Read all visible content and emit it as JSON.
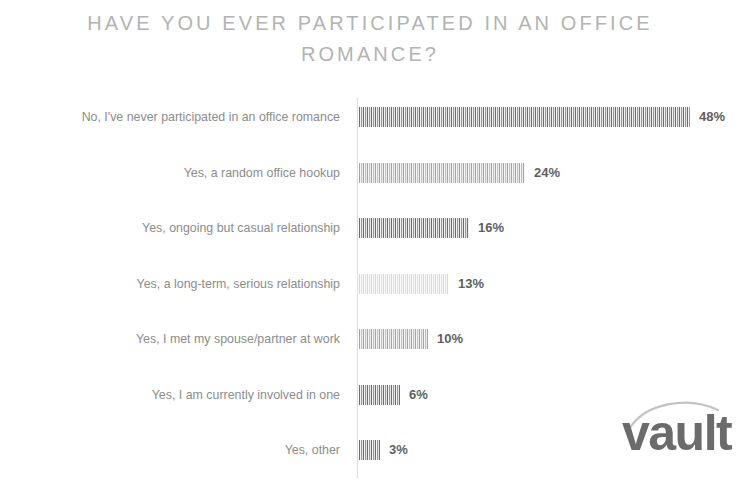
{
  "chart_title": "HAVE YOU EVER PARTICIPATED IN AN OFFICE\nROMANCE?",
  "brand": {
    "logo_text": "vault",
    "logo_color": "#6b6b6b",
    "swoosh_color": "#c4c4c4"
  },
  "colors": {
    "title": "#b3b3b3",
    "category_label": "#8c8c8c",
    "value_label": "#5f5f5f",
    "bar_dark": "#6e6e6e",
    "bar_light": "#f2f2f2",
    "axis": "#dcdcdc",
    "background": "#ffffff"
  },
  "chart_data": {
    "type": "bar",
    "orientation": "horizontal",
    "title": "HAVE YOU EVER PARTICIPATED IN AN OFFICE ROMANCE?",
    "xlabel": "",
    "ylabel": "",
    "xlim": [
      0,
      50
    ],
    "grid": false,
    "legend": "none",
    "value_suffix": "%",
    "categories": [
      "No, I've never participated in an office romance",
      "Yes, a random office hookup",
      "Yes, ongoing but casual relationship",
      "Yes, a long-term, serious relationship",
      "Yes, I met my spouse/partner at work",
      "Yes, I am currently involved in one",
      "Yes, other"
    ],
    "values": [
      48,
      24,
      16,
      13,
      10,
      6,
      3
    ],
    "data_labels": [
      "48%",
      "24%",
      "16%",
      "13%",
      "10%",
      "6%",
      "3%"
    ],
    "bar_styles": [
      "normal",
      "semi",
      "normal",
      "faded",
      "semi",
      "normal",
      "normal"
    ]
  }
}
